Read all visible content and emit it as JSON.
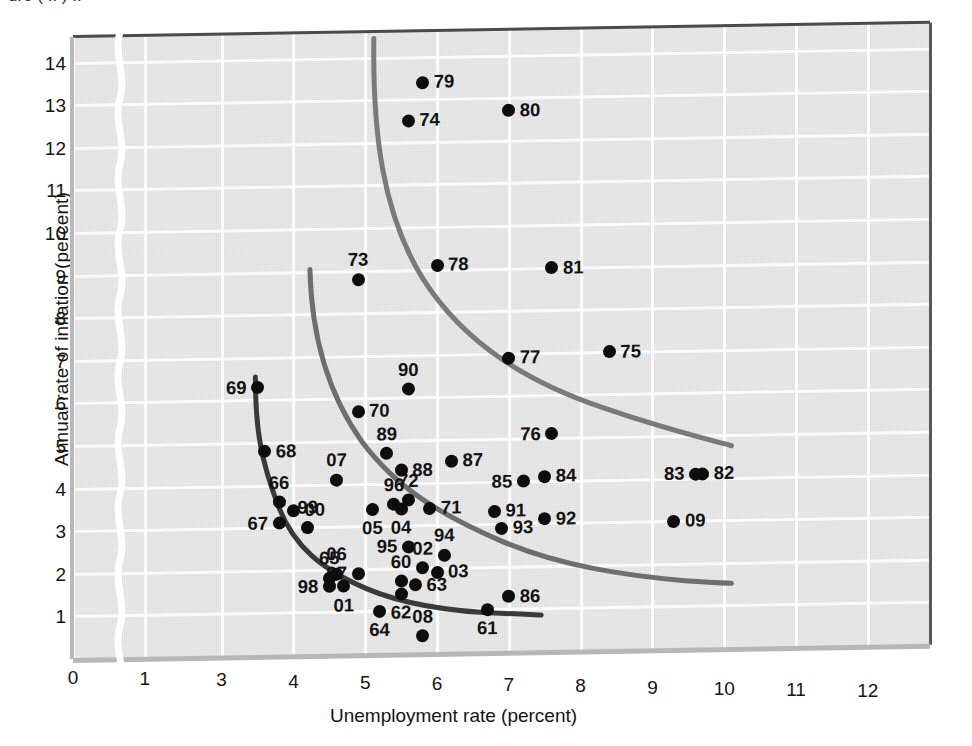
{
  "figure": {
    "partial_top_caption": "ure ( .. ) ..",
    "xlabel": "Unemployment rate (percent)",
    "ylabel": "Annual rate of inflation (percent)",
    "background_color": "#dedede",
    "grid_color": "#fbfbfb",
    "point_color": "#0d0d0d",
    "curve_colors": [
      "#3a3a3a",
      "#6e6e6e",
      "#7a7a7a"
    ],
    "axis_break_note": "x-axis break between 1 and 3"
  },
  "chart_data": {
    "type": "scatter",
    "title": "",
    "xlabel": "Unemployment rate (percent)",
    "ylabel": "Annual rate of inflation (percent)",
    "xlim": [
      0,
      12
    ],
    "ylim": [
      0,
      14.6
    ],
    "xticks": [
      0,
      1,
      3,
      4,
      5,
      6,
      7,
      8,
      9,
      10,
      11,
      12
    ],
    "xtick_labels": [
      "0",
      "1",
      "3",
      "4",
      "5",
      "6",
      "7",
      "8",
      "9",
      "10",
      "11",
      "12"
    ],
    "yticks": [
      1,
      2,
      3,
      4,
      5,
      6,
      7,
      8,
      9,
      10,
      11,
      12,
      13,
      14
    ],
    "ytick_labels": [
      "1",
      "2",
      "3",
      "4",
      "5",
      "6",
      "7",
      "8",
      "9",
      "10",
      "11",
      "12",
      "13",
      "14"
    ],
    "grid": true,
    "legend": "none",
    "axis_break": {
      "axis": "x",
      "between": [
        1,
        3
      ]
    },
    "points": [
      {
        "label": "60",
        "x": 5.5,
        "y": 1.7,
        "lpos": "t"
      },
      {
        "label": "61",
        "x": 6.7,
        "y": 1.0,
        "lpos": "b"
      },
      {
        "label": "62",
        "x": 5.5,
        "y": 1.4,
        "lpos": "b"
      },
      {
        "label": "63",
        "x": 5.7,
        "y": 1.6,
        "lpos": "r"
      },
      {
        "label": "64",
        "x": 5.2,
        "y": 1.0,
        "lpos": "b"
      },
      {
        "label": "65",
        "x": 4.5,
        "y": 1.8,
        "lpos": "t"
      },
      {
        "label": "66",
        "x": 3.8,
        "y": 3.6,
        "lpos": "t"
      },
      {
        "label": "67",
        "x": 3.8,
        "y": 3.1,
        "lpos": "l"
      },
      {
        "label": "68",
        "x": 3.6,
        "y": 4.8,
        "lpos": "r"
      },
      {
        "label": "69",
        "x": 3.5,
        "y": 6.3,
        "lpos": "l"
      },
      {
        "label": "70",
        "x": 4.9,
        "y": 5.7,
        "lpos": "r"
      },
      {
        "label": "71",
        "x": 5.9,
        "y": 3.4,
        "lpos": "r"
      },
      {
        "label": "72",
        "x": 5.6,
        "y": 3.6,
        "lpos": "t"
      },
      {
        "label": "73",
        "x": 4.9,
        "y": 8.8,
        "lpos": "t"
      },
      {
        "label": "74",
        "x": 5.6,
        "y": 12.5,
        "lpos": "r"
      },
      {
        "label": "75",
        "x": 8.4,
        "y": 7.0,
        "lpos": "r"
      },
      {
        "label": "76",
        "x": 7.6,
        "y": 5.1,
        "lpos": "l"
      },
      {
        "label": "77",
        "x": 7.0,
        "y": 6.9,
        "lpos": "r"
      },
      {
        "label": "78",
        "x": 6.0,
        "y": 9.1,
        "lpos": "r"
      },
      {
        "label": "79",
        "x": 5.8,
        "y": 13.4,
        "lpos": "r"
      },
      {
        "label": "80",
        "x": 7.0,
        "y": 12.7,
        "lpos": "r"
      },
      {
        "label": "81",
        "x": 7.6,
        "y": 9.0,
        "lpos": "r"
      },
      {
        "label": "82",
        "x": 9.7,
        "y": 4.1,
        "lpos": "r"
      },
      {
        "label": "83",
        "x": 9.6,
        "y": 4.1,
        "lpos": "l"
      },
      {
        "label": "84",
        "x": 7.5,
        "y": 4.1,
        "lpos": "r"
      },
      {
        "label": "85",
        "x": 7.2,
        "y": 4.0,
        "lpos": "l"
      },
      {
        "label": "86",
        "x": 7.0,
        "y": 1.3,
        "lpos": "r"
      },
      {
        "label": "87",
        "x": 6.2,
        "y": 4.5,
        "lpos": "r"
      },
      {
        "label": "88",
        "x": 5.5,
        "y": 4.3,
        "lpos": "r"
      },
      {
        "label": "89",
        "x": 5.3,
        "y": 4.7,
        "lpos": "t"
      },
      {
        "label": "90",
        "x": 5.6,
        "y": 6.2,
        "lpos": "t"
      },
      {
        "label": "91",
        "x": 6.8,
        "y": 3.3,
        "lpos": "r"
      },
      {
        "label": "92",
        "x": 7.5,
        "y": 3.1,
        "lpos": "r"
      },
      {
        "label": "93",
        "x": 6.9,
        "y": 2.9,
        "lpos": "r"
      },
      {
        "label": "94",
        "x": 6.1,
        "y": 2.3,
        "lpos": "t"
      },
      {
        "label": "95",
        "x": 5.6,
        "y": 2.5,
        "lpos": "l"
      },
      {
        "label": "96",
        "x": 5.4,
        "y": 3.5,
        "lpos": "t"
      },
      {
        "label": "97",
        "x": 4.9,
        "y": 1.9,
        "lpos": "l"
      },
      {
        "label": "98",
        "x": 4.5,
        "y": 1.6,
        "lpos": "l"
      },
      {
        "label": "99",
        "x": 4.2,
        "y": 3.0,
        "lpos": "t"
      },
      {
        "label": "00",
        "x": 4.0,
        "y": 3.4,
        "lpos": "r"
      },
      {
        "label": "01",
        "x": 4.7,
        "y": 1.6,
        "lpos": "b"
      },
      {
        "label": "02",
        "x": 5.8,
        "y": 2.0,
        "lpos": "t"
      },
      {
        "label": "03",
        "x": 6.0,
        "y": 1.9,
        "lpos": "r"
      },
      {
        "label": "04",
        "x": 5.5,
        "y": 3.4,
        "lpos": "b"
      },
      {
        "label": "05",
        "x": 5.1,
        "y": 3.4,
        "lpos": "b"
      },
      {
        "label": "06",
        "x": 4.6,
        "y": 1.9,
        "lpos": "t"
      },
      {
        "label": "07",
        "x": 4.6,
        "y": 4.1,
        "lpos": "t"
      },
      {
        "label": "08",
        "x": 5.8,
        "y": 0.4,
        "lpos": "t"
      },
      {
        "label": "09",
        "x": 9.3,
        "y": 3.0,
        "lpos": "r"
      }
    ],
    "curves": [
      {
        "name": "phillips-curve-1960s",
        "color": "#3a3a3a",
        "width": 5,
        "path": "M 3.47,6.55 C 3.47,5.3 3.55,4.6 3.78,3.55 C 4.0,2.55 4.4,2.0 5.0,1.55 C 5.6,1.1 6.3,0.95 6.95,0.9 C 7.2,0.88 7.35,0.86 7.45,0.85"
      },
      {
        "name": "phillips-curve-1970s",
        "color": "#6e6e6e",
        "width": 5,
        "path": "M 4.23,9.05 C 4.25,7.6 4.45,6.2 4.95,5.0 C 5.45,3.85 6.1,3.2 6.9,2.6 C 7.7,2.0 8.6,1.75 9.45,1.6 C 9.8,1.55 10.0,1.53 10.1,1.52"
      },
      {
        "name": "phillips-curve-1980s",
        "color": "#7a7a7a",
        "width": 5,
        "path": "M 5.12,14.45 C 5.1,12.2 5.25,10.3 5.8,8.8 C 6.4,7.2 7.3,6.3 8.3,5.7 C 9.2,5.15 9.8,4.9 10.1,4.75"
      }
    ]
  }
}
